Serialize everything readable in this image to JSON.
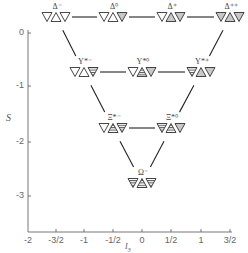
{
  "diagram": {
    "y_axis": {
      "label": "S",
      "ticks": [
        {
          "value": 0,
          "label": "0",
          "y": 33
        },
        {
          "value": -1,
          "label": "-1",
          "y": 86
        },
        {
          "value": -2,
          "label": "-2",
          "y": 142
        },
        {
          "value": -3,
          "label": "-3",
          "y": 196
        }
      ]
    },
    "x_axis": {
      "label": "I",
      "label_sub": "3",
      "ticks": [
        {
          "value": -2,
          "label": "-2",
          "x": 28
        },
        {
          "value": -1.5,
          "label": "-3/2",
          "x": 56
        },
        {
          "value": -1,
          "label": "-1",
          "x": 84
        },
        {
          "value": -0.5,
          "label": "-1/2",
          "x": 113
        },
        {
          "value": 0,
          "label": "0",
          "x": 142
        },
        {
          "value": 0.5,
          "label": "1/2",
          "x": 171
        },
        {
          "value": 1,
          "label": "1",
          "x": 201
        },
        {
          "value": 1.5,
          "label": "3/2",
          "x": 230
        }
      ]
    },
    "legend_fills": {
      "d": "white",
      "u": "gray",
      "s": "striped"
    },
    "colors": {
      "line": "#222222",
      "gray_fill": "#c8c8c8",
      "stripe": "#555555",
      "axis": "#555555",
      "text": "#555555"
    },
    "particles": [
      {
        "id": "delta-minus",
        "name": "Δ⁻",
        "I3": -1.5,
        "S": 0,
        "cx": 56,
        "cy": 17,
        "quarks": [
          "d",
          "d",
          "d"
        ]
      },
      {
        "id": "delta-zero",
        "name": "Δ⁰",
        "I3": -0.5,
        "S": 0,
        "cx": 113,
        "cy": 17,
        "quarks": [
          "d",
          "d",
          "u"
        ]
      },
      {
        "id": "delta-plus",
        "name": "Δ⁺",
        "I3": 0.5,
        "S": 0,
        "cx": 171,
        "cy": 17,
        "quarks": [
          "d",
          "u",
          "u"
        ]
      },
      {
        "id": "delta-plusplus",
        "name": "Δ⁺⁺",
        "I3": 1.5,
        "S": 0,
        "cx": 230,
        "cy": 17,
        "quarks": [
          "u",
          "u",
          "u"
        ]
      },
      {
        "id": "sigma-star-minus",
        "name": "Υ*⁻",
        "I3": -1,
        "S": -1,
        "cx": 84,
        "cy": 72,
        "quarks": [
          "d",
          "d",
          "s"
        ]
      },
      {
        "id": "sigma-star-zero",
        "name": "Υ*⁰",
        "I3": 0,
        "S": -1,
        "cx": 142,
        "cy": 72,
        "quarks": [
          "d",
          "s",
          "u"
        ]
      },
      {
        "id": "sigma-star-plus",
        "name": "Υ*⁺",
        "I3": 1,
        "S": -1,
        "cx": 201,
        "cy": 72,
        "quarks": [
          "s",
          "u",
          "u"
        ]
      },
      {
        "id": "xi-star-minus",
        "name": "Ξ*⁻",
        "I3": -0.5,
        "S": -2,
        "cx": 113,
        "cy": 128,
        "quarks": [
          "d",
          "s",
          "s"
        ]
      },
      {
        "id": "xi-star-zero",
        "name": "Ξ*⁰",
        "I3": 0.5,
        "S": -2,
        "cx": 171,
        "cy": 128,
        "quarks": [
          "s",
          "s",
          "u"
        ]
      },
      {
        "id": "omega-minus",
        "name": "Ω⁻",
        "I3": 0,
        "S": -3,
        "cx": 142,
        "cy": 183,
        "quarks": [
          "s",
          "s",
          "s"
        ]
      }
    ],
    "connections": [
      [
        "delta-minus",
        "delta-zero"
      ],
      [
        "delta-zero",
        "delta-plus"
      ],
      [
        "delta-plus",
        "delta-plusplus"
      ],
      [
        "sigma-star-minus",
        "sigma-star-zero"
      ],
      [
        "sigma-star-zero",
        "sigma-star-plus"
      ],
      [
        "xi-star-minus",
        "xi-star-zero"
      ],
      [
        "delta-minus",
        "sigma-star-minus"
      ],
      [
        "sigma-star-minus",
        "xi-star-minus"
      ],
      [
        "xi-star-minus",
        "omega-minus"
      ],
      [
        "delta-plusplus",
        "sigma-star-plus"
      ],
      [
        "sigma-star-plus",
        "xi-star-zero"
      ],
      [
        "xi-star-zero",
        "omega-minus"
      ]
    ]
  }
}
